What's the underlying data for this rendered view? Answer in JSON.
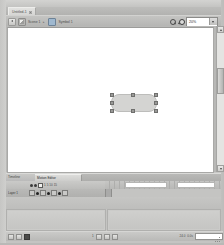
{
  "app": {
    "name": "animation-authoring-tool",
    "window_title": "Untitled-1"
  },
  "document_tabs": [
    {
      "label": "Untitled-1",
      "active": true,
      "close_icon": "close-icon"
    }
  ],
  "edit_bar": {
    "back_icon": "back-arrow-icon",
    "scene_icon": "scene-icon",
    "scene_label": "Scene 1",
    "separator": "",
    "symbol_icon": "symbol-icon",
    "symbol_label": "Symbol 1",
    "fit_icon": "zoom-out-icon",
    "magnify_icon": "zoom-in-icon",
    "zoom_value": "20%",
    "zoom_options": [
      "25%",
      "50%",
      "100%",
      "200%",
      "400%",
      "800%",
      "Fit in Window",
      "Show Frame",
      "Show All"
    ]
  },
  "stage": {
    "background": "#ffffff",
    "selected_shape": {
      "type": "rounded-rectangle",
      "x": 109,
      "y": 94,
      "width": 44,
      "height": 16,
      "fill": "#d4d4d2",
      "stroke": "#bdbdbb",
      "handles": 8
    }
  },
  "scrollbar": {
    "up_icon": "scroll-up-arrow-icon",
    "down_icon": "scroll-down-arrow-icon",
    "thumb_position": 42
  },
  "timeline": {
    "tabs": [
      {
        "label": "Timeline",
        "active": false
      },
      {
        "label": "Motion Editor",
        "active": true
      }
    ],
    "layer_header": {
      "eye_icon": "eye-icon",
      "lock_icon": "lock-icon",
      "outline_icon": "outline-square-icon",
      "columns": [
        "1",
        "5",
        "10",
        "15"
      ]
    },
    "layers": [
      {
        "name": "Layer 1",
        "eye_icon": "eye-icon",
        "lock_icon": "lock-icon",
        "outline_icon": "outline-square-icon",
        "keyframe_icon": "keyframe-dot-icon"
      }
    ],
    "frame_blocks": [
      {
        "start": 20,
        "width": 42
      },
      {
        "start": 72,
        "width": 38
      }
    ],
    "playhead_frame": 1
  },
  "bottom_panels": [
    {
      "name": "properties-panel"
    },
    {
      "name": "library-panel"
    }
  ],
  "status_bar": {
    "left_icons": [
      "arrow-tool-icon",
      "subselect-tool-icon",
      "swatch-icon"
    ],
    "center_icons": [
      "onion-skin-icon",
      "edit-multiple-icon",
      "loop-icon"
    ],
    "frame_label": "1",
    "fps_label": "24.0",
    "time_label": "0.0s",
    "field_value": ""
  }
}
